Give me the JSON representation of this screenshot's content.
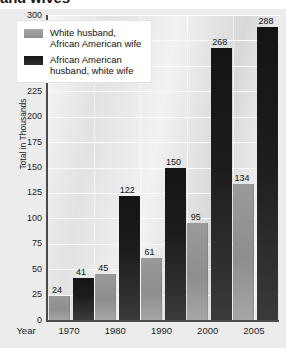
{
  "title": "and wives",
  "chart_data": {
    "type": "bar",
    "title": "and wives",
    "xlabel": "Year",
    "ylabel": "Total in Thousands",
    "ylim": [
      0,
      300
    ],
    "ytick_step": 25,
    "yticks": [
      "300",
      "275",
      "250",
      "225",
      "200",
      "175",
      "150",
      "125",
      "100",
      "75",
      "50",
      "25",
      "0"
    ],
    "grid": true,
    "legend_position": "top-left",
    "categories": [
      "1970",
      "1980",
      "1990",
      "2000",
      "2005"
    ],
    "series": [
      {
        "name": "White husband,\nAfrican American wife",
        "color": "#909090",
        "values": [
          24,
          45,
          61,
          95,
          134
        ]
      },
      {
        "name": "African American\nhusband, white wife",
        "color": "#1a1a1a",
        "values": [
          41,
          122,
          150,
          268,
          288
        ]
      }
    ]
  }
}
